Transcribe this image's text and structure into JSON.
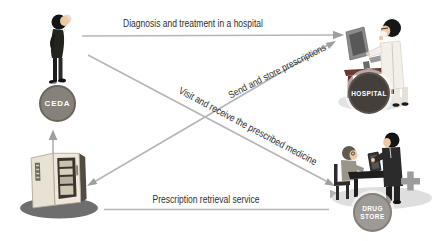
{
  "diagram": {
    "nodes": {
      "ceda": {
        "label": "CEDA",
        "badge_color": "#87817b"
      },
      "hospital": {
        "label": "HOSPITAL",
        "badge_color": "#443f3a"
      },
      "drugstore": {
        "line1": "DRUG",
        "line2": "STORE",
        "badge_color": "#9d9a96"
      },
      "kiosk": {
        "description": "prescription retrieval kiosk machine"
      }
    },
    "arrows": {
      "diagnosis": {
        "label": "Diagnosis and treatment in a hospital",
        "from": "CEDA",
        "to": "HOSPITAL"
      },
      "send_store": {
        "label": "Send and store prescriptions",
        "from": "HOSPITAL",
        "to": "kiosk"
      },
      "visit_receive": {
        "label": "Visit and receive the prescribed medicine",
        "from": "CEDA",
        "to": "DRUG STORE"
      },
      "retrieval": {
        "label": "Prescription retrieval service",
        "from": "kiosk",
        "to": "DRUG STORE"
      },
      "dispense": {
        "label": "",
        "from": "kiosk",
        "to": "CEDA"
      }
    },
    "icons": {
      "patient": "patient-icon",
      "doctor": "doctor-at-computer-icon",
      "pharmacists": "pharmacists-at-table-icon",
      "kiosk": "prescription-kiosk-icon",
      "plus": "plus-icon"
    },
    "colors": {
      "background": "#ffffff",
      "arrow_line": "#b6b6b6",
      "arrow_head": "#9f9f9f",
      "label_text": "#2e2e2e",
      "desk": "#6e3933",
      "plus": "#9c9c9c",
      "kiosk_body": "#ece7da",
      "shadow": "#6e6e6e"
    }
  }
}
